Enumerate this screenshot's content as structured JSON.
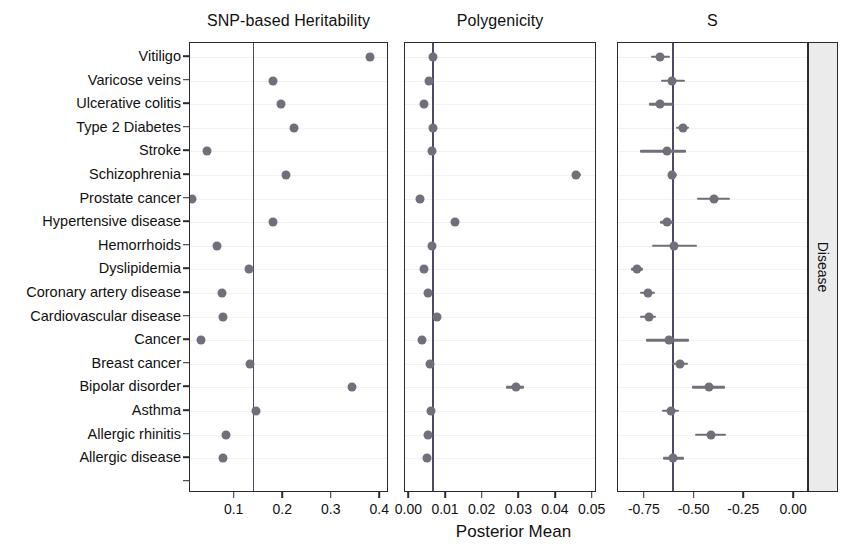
{
  "figure": {
    "axis_title_x": "Posterior Mean",
    "strip_label": "Disease",
    "point_color": "#70707a",
    "refline_color": "#4b4b63",
    "panel_border_color": "#2b2b2b",
    "strip_background": "#ebebeb"
  },
  "diseases": [
    "Vitiligo",
    "Varicose veins",
    "Ulcerative colitis",
    "Type 2 Diabetes",
    "Stroke",
    "Schizophrenia",
    "Prostate cancer",
    "Hypertensive disease",
    "Hemorrhoids",
    "Dyslipidemia",
    "Coronary artery disease",
    "Cardiovascular disease",
    "Cancer",
    "Breast cancer",
    "Bipolar disorder",
    "Asthma",
    "Allergic rhinitis",
    "Allergic disease"
  ],
  "chart_data": {
    "type": "scatter",
    "title": "",
    "xlabel": "Posterior Mean",
    "ylabel": "Disease",
    "grid": true,
    "legend": "none",
    "orientation": "horizontal-forest",
    "categories": [
      "Vitiligo",
      "Varicose veins",
      "Ulcerative colitis",
      "Type 2 Diabetes",
      "Stroke",
      "Schizophrenia",
      "Prostate cancer",
      "Hypertensive disease",
      "Hemorrhoids",
      "Dyslipidemia",
      "Coronary artery disease",
      "Cardiovascular disease",
      "Cancer",
      "Breast cancer",
      "Bipolar disorder",
      "Asthma",
      "Allergic rhinitis",
      "Allergic disease"
    ],
    "panels": [
      {
        "name": "snp-based-heritability",
        "title": "SNP-based Heritability",
        "xlim": [
          0.008,
          0.418
        ],
        "xticks": [
          0.1,
          0.2,
          0.3,
          0.4
        ],
        "xticklabels": [
          "0.1",
          "0.2",
          "0.3",
          "0.4"
        ],
        "refline": 0.137,
        "values": [
          {
            "category": "Vitiligo",
            "mean": 0.378,
            "lo": 0.372,
            "hi": 0.384
          },
          {
            "category": "Varicose veins",
            "mean": 0.178,
            "lo": 0.175,
            "hi": 0.181
          },
          {
            "category": "Ulcerative colitis",
            "mean": 0.195,
            "lo": 0.19,
            "hi": 0.2
          },
          {
            "category": "Type 2 Diabetes",
            "mean": 0.222,
            "lo": 0.219,
            "hi": 0.225
          },
          {
            "category": "Stroke",
            "mean": 0.043,
            "lo": 0.04,
            "hi": 0.046
          },
          {
            "category": "Schizophrenia",
            "mean": 0.206,
            "lo": 0.203,
            "hi": 0.209
          },
          {
            "category": "Prostate cancer",
            "mean": 0.012,
            "lo": 0.01,
            "hi": 0.015
          },
          {
            "category": "Hypertensive disease",
            "mean": 0.18,
            "lo": 0.177,
            "hi": 0.183
          },
          {
            "category": "Hemorrhoids",
            "mean": 0.064,
            "lo": 0.061,
            "hi": 0.067
          },
          {
            "category": "Dyslipidemia",
            "mean": 0.129,
            "lo": 0.126,
            "hi": 0.132
          },
          {
            "category": "Coronary artery disease",
            "mean": 0.073,
            "lo": 0.07,
            "hi": 0.076
          },
          {
            "category": "Cardiovascular disease",
            "mean": 0.076,
            "lo": 0.073,
            "hi": 0.079
          },
          {
            "category": "Cancer",
            "mean": 0.03,
            "lo": 0.028,
            "hi": 0.033
          },
          {
            "category": "Breast cancer",
            "mean": 0.131,
            "lo": 0.128,
            "hi": 0.134
          },
          {
            "category": "Bipolar disorder",
            "mean": 0.342,
            "lo": 0.338,
            "hi": 0.346
          },
          {
            "category": "Asthma",
            "mean": 0.143,
            "lo": 0.14,
            "hi": 0.146
          },
          {
            "category": "Allergic rhinitis",
            "mean": 0.082,
            "lo": 0.079,
            "hi": 0.085
          },
          {
            "category": "Allergic disease",
            "mean": 0.077,
            "lo": 0.074,
            "hi": 0.08
          }
        ]
      },
      {
        "name": "polygenicity",
        "title": "Polygenicity",
        "xlim": [
          -0.0012,
          0.0512
        ],
        "xticks": [
          0.0,
          0.01,
          0.02,
          0.03,
          0.04,
          0.05
        ],
        "xticklabels": [
          "0.00",
          "0.01",
          "0.02",
          "0.03",
          "0.04",
          "0.05"
        ],
        "refline": 0.0062,
        "values": [
          {
            "category": "Vitiligo",
            "mean": 0.0064,
            "lo": 0.0059,
            "hi": 0.0069
          },
          {
            "category": "Varicose veins",
            "mean": 0.0053,
            "lo": 0.0046,
            "hi": 0.006
          },
          {
            "category": "Ulcerative colitis",
            "mean": 0.0039,
            "lo": 0.0033,
            "hi": 0.0045
          },
          {
            "category": "Type 2 Diabetes",
            "mean": 0.0065,
            "lo": 0.006,
            "hi": 0.007
          },
          {
            "category": "Stroke",
            "mean": 0.0062,
            "lo": 0.0053,
            "hi": 0.0071
          },
          {
            "category": "Schizophrenia",
            "mean": 0.0455,
            "lo": 0.0443,
            "hi": 0.0468
          },
          {
            "category": "Prostate cancer",
            "mean": 0.0029,
            "lo": 0.0024,
            "hi": 0.0034
          },
          {
            "category": "Hypertensive disease",
            "mean": 0.0125,
            "lo": 0.012,
            "hi": 0.013
          },
          {
            "category": "Hemorrhoids",
            "mean": 0.0061,
            "lo": 0.0052,
            "hi": 0.007
          },
          {
            "category": "Dyslipidemia",
            "mean": 0.0039,
            "lo": 0.0034,
            "hi": 0.0044
          },
          {
            "category": "Coronary artery disease",
            "mean": 0.005,
            "lo": 0.0044,
            "hi": 0.0056
          },
          {
            "category": "Cardiovascular disease",
            "mean": 0.0074,
            "lo": 0.0068,
            "hi": 0.008
          },
          {
            "category": "Cancer",
            "mean": 0.0035,
            "lo": 0.0029,
            "hi": 0.0041
          },
          {
            "category": "Breast cancer",
            "mean": 0.0056,
            "lo": 0.005,
            "hi": 0.0062
          },
          {
            "category": "Bipolar disorder",
            "mean": 0.029,
            "lo": 0.0264,
            "hi": 0.0314
          },
          {
            "category": "Asthma",
            "mean": 0.0058,
            "lo": 0.0053,
            "hi": 0.0063
          },
          {
            "category": "Allergic rhinitis",
            "mean": 0.0052,
            "lo": 0.0046,
            "hi": 0.0058
          },
          {
            "category": "Allergic disease",
            "mean": 0.0049,
            "lo": 0.0043,
            "hi": 0.0055
          }
        ]
      },
      {
        "name": "s",
        "title": "S",
        "xlim": [
          -0.885,
          0.075
        ],
        "xticks": [
          -0.75,
          -0.5,
          -0.25,
          0.0
        ],
        "xticklabels": [
          "-0.75",
          "-0.50",
          "-0.25",
          "0.00"
        ],
        "refline": -0.613,
        "values": [
          {
            "category": "Vitiligo",
            "mean": -0.673,
            "lo": -0.718,
            "hi": -0.625
          },
          {
            "category": "Varicose veins",
            "mean": -0.612,
            "lo": -0.67,
            "hi": -0.548
          },
          {
            "category": "Ulcerative colitis",
            "mean": -0.672,
            "lo": -0.73,
            "hi": -0.608
          },
          {
            "category": "Type 2 Diabetes",
            "mean": -0.56,
            "lo": -0.592,
            "hi": -0.528
          },
          {
            "category": "Stroke",
            "mean": -0.64,
            "lo": -0.775,
            "hi": -0.545
          },
          {
            "category": "Schizophrenia",
            "mean": -0.613,
            "lo": -0.635,
            "hi": -0.59
          },
          {
            "category": "Prostate cancer",
            "mean": -0.4,
            "lo": -0.49,
            "hi": -0.32
          },
          {
            "category": "Hypertensive disease",
            "mean": -0.64,
            "lo": -0.672,
            "hi": -0.608
          },
          {
            "category": "Hemorrhoids",
            "mean": -0.605,
            "lo": -0.715,
            "hi": -0.49
          },
          {
            "category": "Dyslipidemia",
            "mean": -0.79,
            "lo": -0.822,
            "hi": -0.758
          },
          {
            "category": "Coronary artery disease",
            "mean": -0.735,
            "lo": -0.775,
            "hi": -0.7
          },
          {
            "category": "Cardiovascular disease",
            "mean": -0.73,
            "lo": -0.772,
            "hi": -0.695
          },
          {
            "category": "Cancer",
            "mean": -0.628,
            "lo": -0.742,
            "hi": -0.53
          },
          {
            "category": "Breast cancer",
            "mean": -0.572,
            "lo": -0.612,
            "hi": -0.533
          },
          {
            "category": "Bipolar disorder",
            "mean": -0.43,
            "lo": -0.513,
            "hi": -0.348
          },
          {
            "category": "Asthma",
            "mean": -0.62,
            "lo": -0.665,
            "hi": -0.578
          },
          {
            "category": "Allergic rhinitis",
            "mean": -0.42,
            "lo": -0.5,
            "hi": -0.34
          },
          {
            "category": "Allergic disease",
            "mean": -0.608,
            "lo": -0.66,
            "hi": -0.553
          }
        ]
      }
    ]
  }
}
